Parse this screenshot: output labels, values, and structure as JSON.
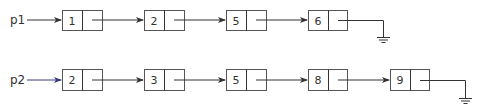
{
  "diagram": {
    "type": "linked-lists",
    "lists": [
      {
        "pointer": "p1",
        "pointer_color": "#333333",
        "nodes": [
          "1",
          "2",
          "5",
          "6"
        ],
        "terminator": "null-ground"
      },
      {
        "pointer": "p2",
        "pointer_color": "#3a3a80",
        "nodes": [
          "2",
          "3",
          "5",
          "8",
          "9"
        ],
        "terminator": "null-ground"
      }
    ]
  }
}
